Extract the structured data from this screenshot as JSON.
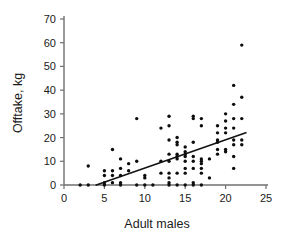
{
  "chart_data": {
    "type": "scatter",
    "title": "",
    "xlabel": "Adult males",
    "ylabel": "Offtake, kg",
    "xlim": [
      0,
      25
    ],
    "ylim": [
      0,
      70
    ],
    "xticks": [
      0,
      5,
      10,
      15,
      20,
      25
    ],
    "yticks": [
      0,
      10,
      20,
      30,
      40,
      50,
      60,
      70
    ],
    "grid": false,
    "legend": null,
    "marker": "filled-circle",
    "marker_color": "#0d0d0d",
    "axis_color": "#6f6f6f",
    "fit_line": {
      "type": "linear-regression",
      "color": "#111111",
      "x_start": 4.0,
      "y_start": 0,
      "x_end": 22.5,
      "y_end": 22
    },
    "points": [
      [
        2,
        0
      ],
      [
        3,
        8
      ],
      [
        3,
        0
      ],
      [
        5,
        6
      ],
      [
        5,
        4
      ],
      [
        5,
        1
      ],
      [
        5,
        0
      ],
      [
        6,
        15
      ],
      [
        6,
        6
      ],
      [
        6,
        4
      ],
      [
        6,
        1
      ],
      [
        7,
        11
      ],
      [
        7,
        7
      ],
      [
        7,
        4
      ],
      [
        7,
        1
      ],
      [
        7,
        0
      ],
      [
        8,
        9
      ],
      [
        8,
        6
      ],
      [
        9,
        28
      ],
      [
        9,
        10
      ],
      [
        9,
        0
      ],
      [
        10,
        4
      ],
      [
        10,
        3
      ],
      [
        10,
        0
      ],
      [
        11,
        0
      ],
      [
        12,
        24
      ],
      [
        12,
        10
      ],
      [
        12,
        5
      ],
      [
        13,
        29
      ],
      [
        13,
        25
      ],
      [
        13,
        19
      ],
      [
        13,
        13
      ],
      [
        13,
        10
      ],
      [
        13,
        5
      ],
      [
        13,
        3
      ],
      [
        13,
        1
      ],
      [
        13,
        0
      ],
      [
        14,
        20
      ],
      [
        14,
        18
      ],
      [
        14,
        17
      ],
      [
        14,
        13
      ],
      [
        14,
        12
      ],
      [
        14,
        11
      ],
      [
        14,
        5
      ],
      [
        14,
        0
      ],
      [
        15,
        16
      ],
      [
        15,
        14
      ],
      [
        15,
        13
      ],
      [
        15,
        12
      ],
      [
        15,
        10
      ],
      [
        15,
        7
      ],
      [
        15,
        5
      ],
      [
        15,
        0
      ],
      [
        16,
        29
      ],
      [
        16,
        28
      ],
      [
        16,
        18
      ],
      [
        16,
        12
      ],
      [
        16,
        10
      ],
      [
        16,
        7
      ],
      [
        16,
        1
      ],
      [
        16,
        0
      ],
      [
        17,
        28
      ],
      [
        17,
        25
      ],
      [
        17,
        11
      ],
      [
        17,
        10
      ],
      [
        17,
        9
      ],
      [
        17,
        7
      ],
      [
        17,
        5
      ],
      [
        17,
        0
      ],
      [
        18,
        11
      ],
      [
        18,
        3
      ],
      [
        19,
        25
      ],
      [
        19,
        22
      ],
      [
        19,
        19
      ],
      [
        19,
        18
      ],
      [
        19,
        15
      ],
      [
        19,
        13
      ],
      [
        20,
        30
      ],
      [
        20,
        27
      ],
      [
        20,
        24
      ],
      [
        20,
        22
      ],
      [
        20,
        15
      ],
      [
        20,
        14
      ],
      [
        21,
        42
      ],
      [
        21,
        34
      ],
      [
        21,
        28
      ],
      [
        21,
        24
      ],
      [
        21,
        19
      ],
      [
        21,
        17
      ],
      [
        21,
        12
      ],
      [
        21,
        7
      ],
      [
        22,
        59
      ],
      [
        22,
        37
      ],
      [
        22,
        28
      ],
      [
        22,
        19
      ],
      [
        22,
        17
      ]
    ]
  },
  "axes": {
    "x_title": "Adult males",
    "y_title": "Offtake, kg",
    "x_tick_labels": [
      "0",
      "5",
      "10",
      "15",
      "20",
      "25"
    ],
    "y_tick_labels": [
      "0",
      "10",
      "20",
      "30",
      "40",
      "50",
      "60",
      "70"
    ]
  }
}
